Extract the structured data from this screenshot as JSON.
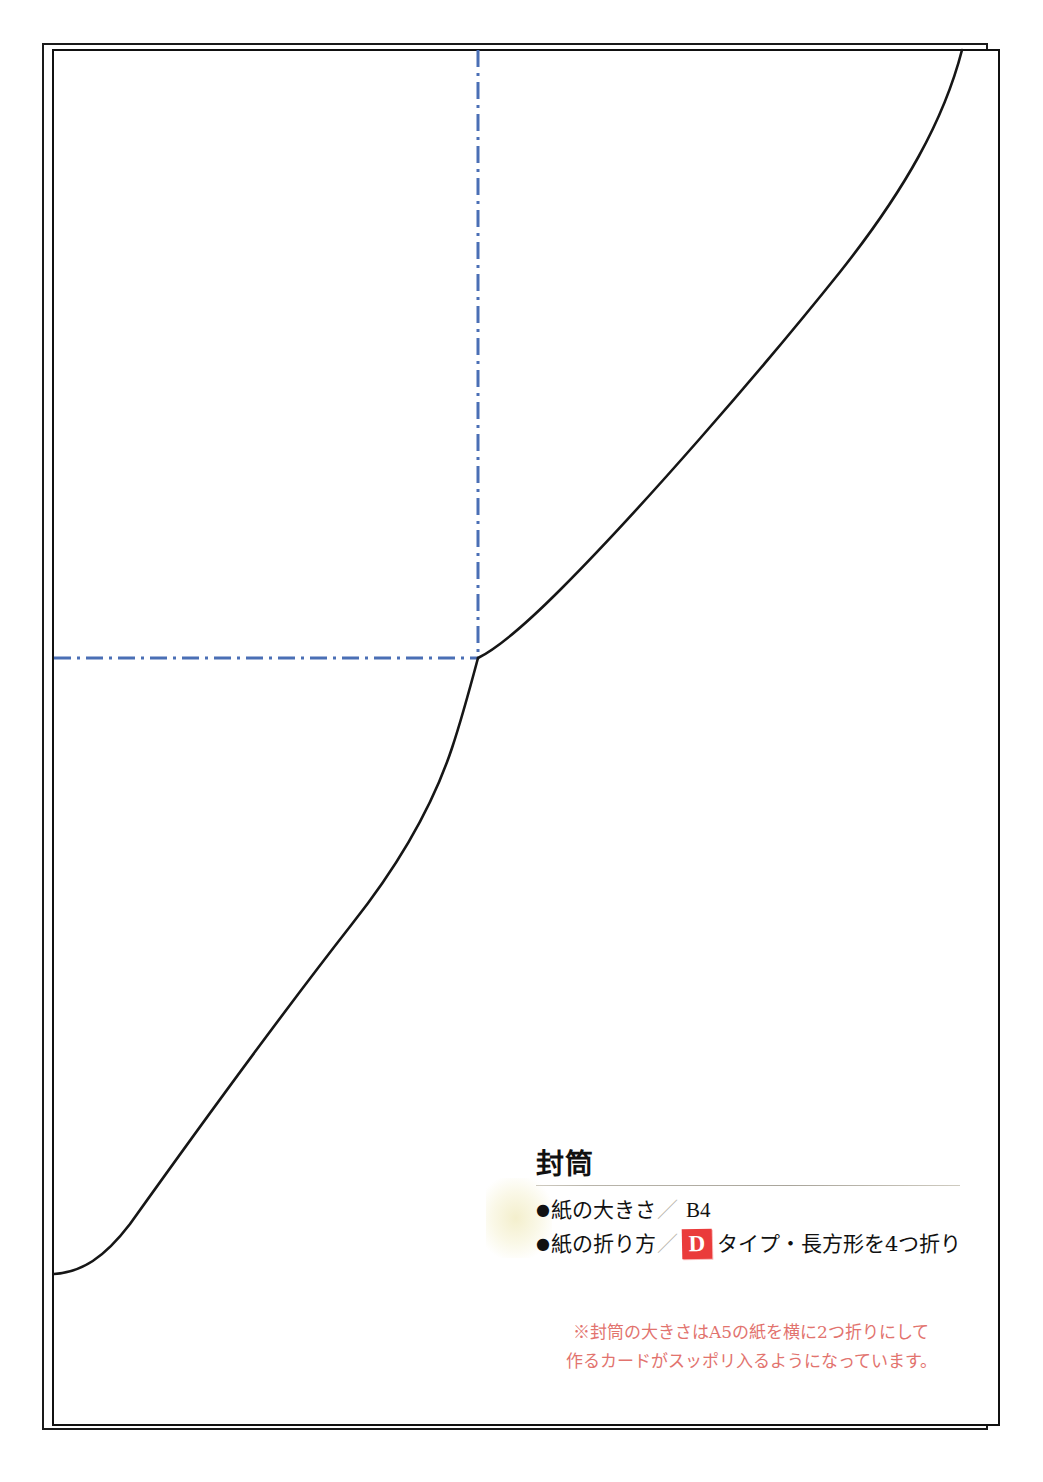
{
  "document": {
    "kind": "craft-template-sheet",
    "background_color": "#ffffff"
  },
  "guides": {
    "fold_line_color": "#4a6fb5",
    "cut_line_color": "#1a1a1a",
    "vertical_fold_x": 478,
    "horizontal_fold_y": 658,
    "dash_pattern": "dash-dot"
  },
  "caption": {
    "title": "封筒",
    "specs": [
      {
        "bullet": "●",
        "label": "紙の大きさ",
        "separator": "／",
        "value": "B4"
      },
      {
        "bullet": "●",
        "label": "紙の折り方",
        "separator": "／",
        "badge": "D",
        "value": "タイプ・長方形を4つ折り"
      }
    ],
    "badge_color": "#ea3b3b",
    "note_color": "#e2736e",
    "note_lines": [
      "※封筒の大きさはA5の紙を横に2つ折りにして",
      "作るカードがスッポリ入るようになっています。"
    ]
  }
}
